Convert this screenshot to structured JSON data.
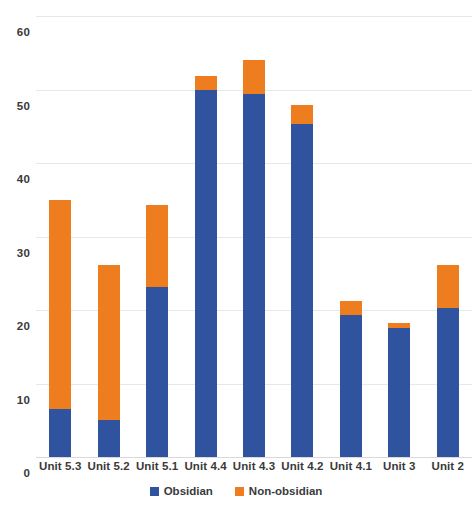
{
  "chart_data": {
    "type": "bar",
    "subtype": "stacked-column",
    "title": "",
    "xlabel": "",
    "ylabel": "",
    "ylim": [
      0,
      60
    ],
    "yticks": [
      0,
      10,
      20,
      30,
      40,
      50,
      60
    ],
    "grid": true,
    "legend_position": "bottom",
    "categories": [
      "Unit 5.3",
      "Unit 5.2",
      "Unit 5.1",
      "Unit 4.4",
      "Unit 4.3",
      "Unit 4.2",
      "Unit 4.1",
      "Unit 3",
      "Unit 2"
    ],
    "series": [
      {
        "name": "Obsidian",
        "color": "#2F539E",
        "values": [
          6.6,
          5.0,
          23.1,
          50.0,
          49.4,
          45.3,
          19.3,
          17.5,
          20.3
        ]
      },
      {
        "name": "Non-obsidian",
        "color": "#ED7D1F",
        "values": [
          28.4,
          21.1,
          11.2,
          1.8,
          4.6,
          2.6,
          1.9,
          0.7,
          5.8
        ]
      }
    ],
    "totals": [
      35.0,
      26.1,
      34.3,
      51.8,
      54.0,
      47.9,
      21.2,
      18.2,
      26.1
    ]
  },
  "axis": {
    "ytick_labels": [
      "60",
      "50",
      "40",
      "30",
      "20",
      "10",
      "0"
    ]
  },
  "legend": {
    "items": [
      {
        "label": "Obsidian",
        "color": "#2F539E"
      },
      {
        "label": "Non-obsidian",
        "color": "#ED7D1F"
      }
    ]
  },
  "caption": {
    "text": ""
  },
  "colors": {
    "obsidian": "#2F539E",
    "non_obsidian": "#ED7D1F",
    "gridline": "#e8e8e8",
    "text": "#3a3a3a",
    "background": "#ffffff"
  }
}
